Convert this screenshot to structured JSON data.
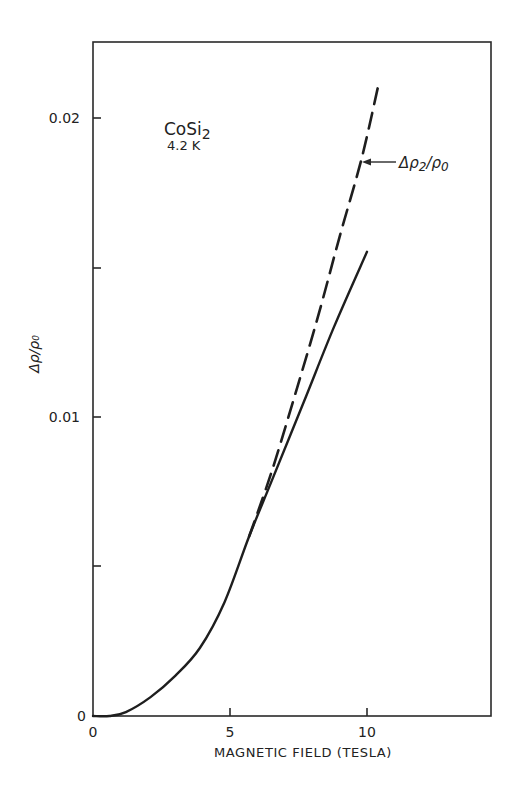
{
  "chart_data": {
    "type": "line",
    "title": "",
    "xlabel": "MAGNETIC FIELD (TESLA)",
    "ylabel": "Δρ/ρ₀",
    "xlim": [
      0,
      14.5
    ],
    "ylim": [
      0,
      0.0225
    ],
    "grid": false,
    "x_ticks": [
      0,
      5,
      10
    ],
    "x_tick_labels": [
      "0",
      "5",
      "10"
    ],
    "y_ticks": [
      0,
      0.005,
      0.01,
      0.015,
      0.02
    ],
    "y_tick_labels": [
      "0",
      "",
      "0.01",
      "",
      "0.02"
    ],
    "annotations": [
      {
        "text": "CoSi₂",
        "main": "CoSi",
        "sub": "2"
      },
      {
        "text": "4.2 K"
      },
      {
        "text": "Δρ₂/ρ₀",
        "arrow_to_series": "dashed",
        "at_x": 9.8,
        "at_y": 0.0185
      }
    ],
    "series": [
      {
        "name": "Δρ/ρ₀ (measured)",
        "style": "solid",
        "x": [
          0,
          0.6,
          1.2,
          2.1,
          3.0,
          3.9,
          4.8,
          5.7,
          6.5,
          7.7,
          8.8,
          10.0
        ],
        "y": [
          0,
          0.0,
          0.00013,
          0.00063,
          0.00134,
          0.00227,
          0.0038,
          0.006,
          0.0078,
          0.0105,
          0.013,
          0.0155
        ]
      },
      {
        "name": "Δρ₂/ρ₀",
        "style": "dashed",
        "x": [
          5.7,
          6.5,
          7.3,
          8.2,
          9.0,
          9.8,
          10.4
        ],
        "y": [
          0.006,
          0.0081,
          0.0105,
          0.0133,
          0.016,
          0.0186,
          0.021
        ]
      }
    ]
  },
  "labels": {
    "y_axis": "Δρ/ρ₀",
    "x_axis": "MAGNETIC FIELD (TESLA)",
    "sample": "CoSi",
    "sample_sub": "2",
    "temperature": "4.2 K",
    "dashed_label_main": "Δρ",
    "dashed_label_sub": "2",
    "dashed_label_tail": "/ρ",
    "dashed_label_sub2": "0",
    "tick_y_0": "0",
    "tick_y_001": "0.01",
    "tick_y_002": "0.02",
    "tick_x_0": "0",
    "tick_x_5": "5",
    "tick_x_10": "10"
  }
}
